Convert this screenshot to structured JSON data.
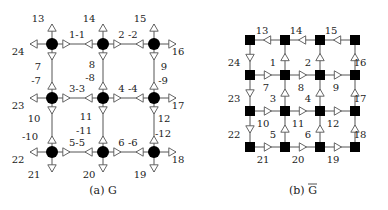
{
  "figures": [
    {
      "id": "a",
      "caption": "(a) G",
      "node_shape": "circle",
      "nodes": [
        [
          52,
          44
        ],
        [
          103,
          44
        ],
        [
          154,
          44
        ],
        [
          52,
          98
        ],
        [
          103,
          98
        ],
        [
          154,
          98
        ],
        [
          52,
          152
        ],
        [
          103,
          152
        ],
        [
          154,
          152
        ]
      ],
      "edge_labels": [
        {
          "text": "1-1",
          "x": 77,
          "y": 38
        },
        {
          "text": "2 -2",
          "x": 128,
          "y": 38
        },
        {
          "text": "3-3",
          "x": 77,
          "y": 92
        },
        {
          "text": "4 -4",
          "x": 128,
          "y": 92
        },
        {
          "text": "5-5",
          "x": 77,
          "y": 146
        },
        {
          "text": "6 -6",
          "x": 128,
          "y": 146
        },
        {
          "text": "7",
          "x": 38,
          "y": 70
        },
        {
          "text": "-7",
          "x": 36,
          "y": 84
        },
        {
          "text": "8",
          "x": 92,
          "y": 68
        },
        {
          "text": "-8",
          "x": 90,
          "y": 81
        },
        {
          "text": "9",
          "x": 164,
          "y": 70
        },
        {
          "text": "-9",
          "x": 163,
          "y": 84
        },
        {
          "text": "10",
          "x": 34,
          "y": 122
        },
        {
          "text": "-10",
          "x": 30,
          "y": 140
        },
        {
          "text": "11",
          "x": 86,
          "y": 120
        },
        {
          "text": "-11",
          "x": 84,
          "y": 134
        },
        {
          "text": "12",
          "x": 164,
          "y": 122
        },
        {
          "text": "-12",
          "x": 163,
          "y": 137
        }
      ],
      "terminal_labels": [
        {
          "text": "13",
          "x": 38,
          "y": 22
        },
        {
          "text": "14",
          "x": 89,
          "y": 22
        },
        {
          "text": "15",
          "x": 140,
          "y": 22
        },
        {
          "text": "16",
          "x": 178,
          "y": 55
        },
        {
          "text": "17",
          "x": 178,
          "y": 109
        },
        {
          "text": "18",
          "x": 178,
          "y": 163
        },
        {
          "text": "19",
          "x": 140,
          "y": 178
        },
        {
          "text": "20",
          "x": 89,
          "y": 178
        },
        {
          "text": "21",
          "x": 34,
          "y": 178
        },
        {
          "text": "22",
          "x": 18,
          "y": 163
        },
        {
          "text": "23",
          "x": 18,
          "y": 109
        },
        {
          "text": "24",
          "x": 18,
          "y": 55
        }
      ]
    },
    {
      "id": "b",
      "caption": "(b) G",
      "caption_overline": true,
      "node_shape": "square",
      "nodes": [
        [
          250,
          40
        ],
        [
          285,
          40
        ],
        [
          320,
          40
        ],
        [
          355,
          40
        ],
        [
          250,
          75
        ],
        [
          285,
          75
        ],
        [
          320,
          75
        ],
        [
          355,
          75
        ],
        [
          250,
          111
        ],
        [
          285,
          111
        ],
        [
          320,
          111
        ],
        [
          355,
          111
        ],
        [
          250,
          147
        ],
        [
          285,
          147
        ],
        [
          320,
          147
        ],
        [
          355,
          147
        ]
      ],
      "labels": [
        {
          "text": "13",
          "x": 262,
          "y": 34
        },
        {
          "text": "14",
          "x": 296,
          "y": 34
        },
        {
          "text": "15",
          "x": 331,
          "y": 34
        },
        {
          "text": "24",
          "x": 234,
          "y": 66
        },
        {
          "text": "1",
          "x": 273,
          "y": 66
        },
        {
          "text": "2",
          "x": 308,
          "y": 66
        },
        {
          "text": "16",
          "x": 360,
          "y": 66
        },
        {
          "text": "7",
          "x": 266,
          "y": 91
        },
        {
          "text": "8",
          "x": 301,
          "y": 91
        },
        {
          "text": "9",
          "x": 336,
          "y": 91
        },
        {
          "text": "23",
          "x": 234,
          "y": 102
        },
        {
          "text": "3",
          "x": 273,
          "y": 102
        },
        {
          "text": "4",
          "x": 308,
          "y": 102
        },
        {
          "text": "17",
          "x": 360,
          "y": 102
        },
        {
          "text": "10",
          "x": 263,
          "y": 127
        },
        {
          "text": "11",
          "x": 298,
          "y": 127
        },
        {
          "text": "12",
          "x": 333,
          "y": 127
        },
        {
          "text": "22",
          "x": 234,
          "y": 138
        },
        {
          "text": "5",
          "x": 273,
          "y": 138
        },
        {
          "text": "6",
          "x": 308,
          "y": 138
        },
        {
          "text": "18",
          "x": 360,
          "y": 138
        },
        {
          "text": "21",
          "x": 263,
          "y": 163
        },
        {
          "text": "20",
          "x": 298,
          "y": 163
        },
        {
          "text": "19",
          "x": 333,
          "y": 163
        }
      ]
    }
  ]
}
